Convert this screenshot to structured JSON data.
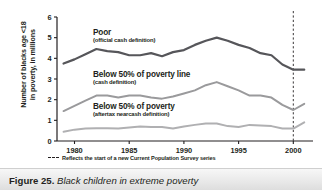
{
  "figure": {
    "caption_number": "Figure 25.",
    "caption_title": "Black children in extreme poverty"
  },
  "footnote": {
    "marker": "dashed-line-key",
    "text": "Reflects the start of a new Current Population Survey series"
  },
  "annotations": {
    "poor": {
      "title": "Poor",
      "subtitle": "(official cash definition)"
    },
    "below50_cash": {
      "title": "Below 50% of poverty line",
      "subtitle": "(cash definition)"
    },
    "below50_aftertax": {
      "title": "Below 50% of poverty",
      "subtitle": "(aftertax nearcash definition)"
    }
  },
  "axis": {
    "y_title_line1": "Number of blacks age <18",
    "y_title_line2": "in poverty, in millions"
  },
  "colors": {
    "poor_line": "#56565a",
    "below50_cash_line": "#9a9a9c",
    "below50_aftertax_line": "#b0b0b2",
    "axis": "#231f20",
    "text": "#231f20",
    "caption_bar": "#e9e9e9"
  },
  "chart_data": {
    "type": "line",
    "title": "Black children in extreme poverty",
    "xlabel": "",
    "ylabel": "Number of blacks age <18 in poverty, in millions",
    "xlim": [
      1978.4,
      2001.8
    ],
    "ylim": [
      0,
      6
    ],
    "yticks": [
      0,
      1,
      2,
      3,
      4,
      5,
      6
    ],
    "ytick_labels": [
      "0",
      "1",
      "2",
      "3",
      "4",
      "5",
      "6"
    ],
    "xticks": [
      1980,
      1985,
      1990,
      1995,
      2000
    ],
    "xtick_labels": [
      "1980",
      "1985",
      "1990",
      "1995",
      "2000"
    ],
    "grid": false,
    "legend": "inline-annotations",
    "x": [
      1979,
      1980,
      1981,
      1982,
      1983,
      1984,
      1985,
      1986,
      1987,
      1988,
      1989,
      1990,
      1991,
      1992,
      1993,
      1994,
      1995,
      1996,
      1997,
      1998,
      1999,
      2000,
      2001
    ],
    "series": [
      {
        "name": "Poor (official cash definition)",
        "color": "#56565a",
        "values": [
          3.75,
          3.95,
          4.2,
          4.45,
          4.35,
          4.3,
          4.15,
          4.15,
          4.25,
          4.1,
          4.3,
          4.4,
          4.65,
          4.85,
          5.0,
          4.85,
          4.65,
          4.5,
          4.25,
          4.15,
          3.7,
          3.45,
          3.45
        ]
      },
      {
        "name": "Below 50% of poverty line (cash definition)",
        "color": "#9a9a9c",
        "values": [
          1.45,
          1.7,
          1.95,
          2.2,
          2.2,
          2.1,
          2.2,
          2.2,
          2.1,
          2.05,
          2.15,
          2.3,
          2.45,
          2.7,
          2.85,
          2.65,
          2.45,
          2.2,
          2.2,
          2.1,
          1.75,
          1.5,
          1.8
        ]
      },
      {
        "name": "Below 50% of poverty (aftertax nearcash definition)",
        "color": "#b0b0b2",
        "values": [
          0.45,
          0.55,
          0.6,
          0.62,
          0.62,
          0.6,
          0.65,
          0.7,
          0.68,
          0.68,
          0.6,
          0.7,
          0.78,
          0.85,
          0.85,
          0.72,
          0.68,
          0.78,
          0.75,
          0.72,
          0.6,
          0.6,
          0.9
        ]
      }
    ],
    "annotations": [
      {
        "kind": "vline",
        "x": 2000,
        "style": "dashed",
        "note": "Reflects the start of a new Current Population Survey series"
      }
    ]
  }
}
